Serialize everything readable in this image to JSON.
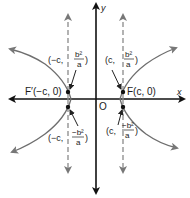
{
  "diagram": {
    "type": "hyperbola-latus-rectum",
    "axes": {
      "x_label": "x",
      "y_label": "y",
      "origin_label": "O"
    },
    "foci": [
      {
        "id": "left",
        "label": "F′(−c, 0)"
      },
      {
        "id": "right",
        "label": "F(c, 0)"
      }
    ],
    "endpoints": {
      "upper_left": {
        "prefix": "(−c,",
        "num": "b²",
        "den": "a",
        "suffix": ")"
      },
      "upper_right": {
        "prefix": "(c,",
        "num": "b²",
        "den": "a",
        "suffix": ")"
      },
      "lower_left": {
        "prefix": "(−c,",
        "num": "−b²",
        "den": "a",
        "suffix": ")"
      },
      "lower_right": {
        "prefix": "(c,",
        "num": "−b²",
        "den": "a",
        "suffix": ")"
      }
    },
    "colors": {
      "axis": "#111111",
      "curve": "#6e6e6e",
      "dashed": "#8a8a8a",
      "text": "#1a1a1a",
      "focus_dot": "#111111"
    }
  }
}
